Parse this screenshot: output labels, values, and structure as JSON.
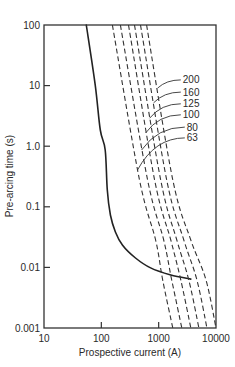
{
  "chart_data": {
    "type": "line",
    "title": "",
    "xlabel": "Prospective current (A)",
    "ylabel": "Pre-arcing time (s)",
    "xscale": "log",
    "yscale": "log",
    "xlim": [
      10,
      10000
    ],
    "ylim": [
      0.001,
      100
    ],
    "grid": false,
    "legend": "inline labels with leader lines (right side)",
    "x_ticks": [
      {
        "value": 10,
        "label": "10"
      },
      {
        "value": 100,
        "label": "100"
      },
      {
        "value": 1000,
        "label": "1000"
      },
      {
        "value": 10000,
        "label": "10000"
      }
    ],
    "y_ticks": [
      {
        "value": 100,
        "label": "100"
      },
      {
        "value": 10,
        "label": "10"
      },
      {
        "value": 1,
        "label": "1.0"
      },
      {
        "value": 0.1,
        "label": "0.1"
      },
      {
        "value": 0.01,
        "label": "0.01"
      },
      {
        "value": 0.001,
        "label": "0.001"
      }
    ],
    "series": [
      {
        "name": "solid curve",
        "style": "solid",
        "points": [
          [
            54.6,
            100
          ],
          [
            78.5,
            10
          ],
          [
            95.9,
            1.85
          ],
          [
            117,
            0.865
          ],
          [
            127,
            0.189
          ],
          [
            144,
            0.0733
          ],
          [
            176,
            0.0384
          ],
          [
            233,
            0.0234
          ],
          [
            394,
            0.0143
          ],
          [
            724,
            0.0098
          ],
          [
            1625,
            0.0075
          ],
          [
            3640,
            0.0064
          ]
        ]
      },
      {
        "name": "63",
        "style": "dashed",
        "points": [
          [
            156,
            100
          ],
          [
            464,
            0.277
          ],
          [
            885,
            0.0283
          ],
          [
            1175,
            0.0062
          ],
          [
            1762,
            0.001
          ]
        ],
        "label_pos": [
          3097,
          1.37
        ],
        "label_target": [
          428,
          0.405
        ]
      },
      {
        "name": "80",
        "style": "dashed",
        "points": [
          [
            215,
            100
          ],
          [
            641,
            0.277
          ],
          [
            1224,
            0.0283
          ],
          [
            1690,
            0.0062
          ],
          [
            2535,
            0.001
          ]
        ],
        "label_pos": [
          3097,
          2.07
        ],
        "label_target": [
          503,
          0.865
        ]
      },
      {
        "name": "100",
        "style": "dashed",
        "points": [
          [
            298,
            100
          ],
          [
            851,
            0.277
          ],
          [
            1625,
            0.0283
          ],
          [
            2432,
            0.0062
          ],
          [
            3640,
            0.001
          ]
        ],
        "label_pos": [
          2637,
          3.3
        ],
        "label_target": [
          591,
          1.65
        ]
      },
      {
        "name": "125",
        "style": "dashed",
        "points": [
          [
            379,
            100
          ],
          [
            1084,
            0.277
          ],
          [
            2069,
            0.0283
          ],
          [
            3357,
            0.0062
          ],
          [
            5035,
            0.001
          ]
        ],
        "label_pos": [
          2637,
          5.0
        ],
        "label_target": [
          695,
          2.9
        ]
      },
      {
        "name": "160",
        "style": "dashed",
        "points": [
          [
            483,
            100
          ],
          [
            1381,
            0.277
          ],
          [
            2748,
            0.0283
          ],
          [
            4645,
            0.0062
          ],
          [
            6950,
            0.001
          ]
        ],
        "label_pos": [
          2637,
          7.8
        ],
        "label_target": [
          817,
          5.2
        ]
      },
      {
        "name": "200",
        "style": "dashed",
        "points": [
          [
            615,
            100
          ],
          [
            1762,
            0.277
          ],
          [
            3640,
            0.0283
          ],
          [
            6685,
            0.0062
          ],
          [
            10000,
            0.001
          ]
        ],
        "label_pos": [
          2637,
          12.4
        ],
        "label_target": [
          959,
          9.1
        ]
      }
    ]
  }
}
